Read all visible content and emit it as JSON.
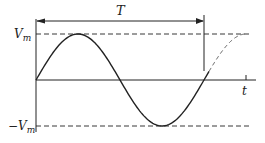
{
  "diagram": {
    "labels": {
      "period": "T",
      "time_axis": "t",
      "positive_peak": "V",
      "positive_peak_sub": "m",
      "negative_peak_prefix": "−V",
      "negative_peak_sub": "m"
    },
    "waveform": {
      "type": "sine",
      "amplitude_label": "Vm",
      "cycles_solid": 1,
      "dashed_continuation_cycles": 0.25
    },
    "colors": {
      "stroke": "#222222",
      "background": "#ffffff"
    }
  }
}
